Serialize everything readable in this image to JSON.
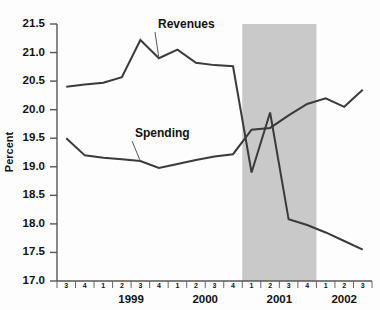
{
  "chart_data": {
    "type": "line",
    "title": "",
    "xlabel": "",
    "ylabel": "Percent",
    "ylim": [
      17.0,
      21.5
    ],
    "ytick_step": 0.5,
    "yticks": [
      "17.0",
      "17.5",
      "18.0",
      "18.5",
      "19.0",
      "19.5",
      "20.0",
      "20.5",
      "21.0",
      "21.5"
    ],
    "grid": false,
    "legend_position": "inline-annotation",
    "x": [
      "1998 Q3",
      "1998 Q4",
      "1999 Q1",
      "1999 Q2",
      "1999 Q3",
      "1999 Q4",
      "2000 Q1",
      "2000 Q2",
      "2000 Q3",
      "2000 Q4",
      "2001 Q1",
      "2001 Q2",
      "2001 Q3",
      "2001 Q4",
      "2002 Q1",
      "2002 Q2",
      "2002 Q3"
    ],
    "quarter_ticks": [
      "3",
      "4",
      "1",
      "2",
      "3",
      "4",
      "1",
      "2",
      "3",
      "4",
      "1",
      "2",
      "3",
      "4",
      "1",
      "2",
      "3"
    ],
    "year_groups": [
      {
        "label": "1999",
        "start_index": 2,
        "end_index": 5
      },
      {
        "label": "2000",
        "start_index": 6,
        "end_index": 9
      },
      {
        "label": "2001",
        "start_index": 10,
        "end_index": 13
      },
      {
        "label": "2002",
        "start_index": 14,
        "end_index": 16
      }
    ],
    "series": [
      {
        "name": "Revenues",
        "color": "#3a3a3a",
        "values": [
          20.4,
          20.44,
          20.47,
          20.57,
          21.22,
          20.9,
          21.05,
          20.82,
          20.78,
          20.76,
          18.9,
          19.95,
          18.08,
          17.98,
          17.85,
          17.7,
          17.55
        ],
        "label_anchor_index": 5,
        "label_text": "Revenues"
      },
      {
        "name": "Spending",
        "color": "#3a3a3a",
        "values": [
          19.5,
          19.2,
          19.16,
          19.13,
          19.1,
          18.98,
          19.05,
          19.12,
          19.18,
          19.22,
          19.65,
          19.68,
          19.9,
          20.1,
          20.2,
          20.05,
          20.35
        ],
        "label_anchor_index": 4,
        "label_text": "Spending"
      }
    ],
    "annotations": [
      {
        "name": "recession-band",
        "type": "vspan",
        "start": "2001 Q1",
        "end": "2001 Q4",
        "color": "#c9c9c9"
      }
    ]
  }
}
